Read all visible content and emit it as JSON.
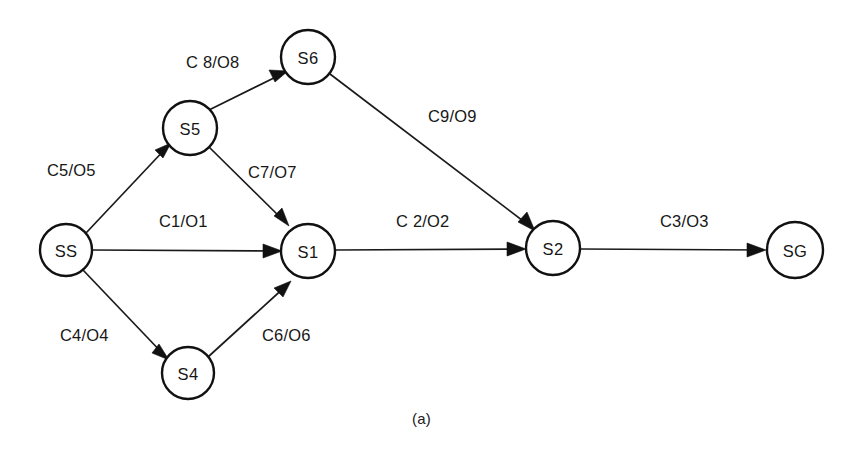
{
  "figure": {
    "caption": "(a)",
    "background_color": "#ffffff",
    "stroke_color": "#111111",
    "text_color": "#171717"
  },
  "diagram": {
    "type": "state-transition-diagram",
    "nodes": [
      {
        "id": "SS",
        "label": "SS",
        "cx": 66,
        "cy": 250,
        "r": 26
      },
      {
        "id": "S5",
        "label": "S5",
        "cx": 190,
        "cy": 128,
        "r": 27
      },
      {
        "id": "S6",
        "label": "S6",
        "cx": 308,
        "cy": 57,
        "r": 27
      },
      {
        "id": "S1",
        "label": "S1",
        "cx": 308,
        "cy": 251,
        "r": 27
      },
      {
        "id": "S4",
        "label": "S4",
        "cx": 188,
        "cy": 373,
        "r": 26
      },
      {
        "id": "S2",
        "label": "S2",
        "cx": 553,
        "cy": 248,
        "r": 27
      },
      {
        "id": "SG",
        "label": "SG",
        "cx": 795,
        "cy": 250,
        "r": 28
      }
    ],
    "edges": [
      {
        "id": "e5",
        "from": "SS",
        "to": "S5",
        "label": "C5/O5",
        "label_x": 47,
        "label_y": 162
      },
      {
        "id": "e1",
        "from": "SS",
        "to": "S1",
        "label": "C1/O1",
        "label_x": 159,
        "label_y": 213
      },
      {
        "id": "e4",
        "from": "SS",
        "to": "S4",
        "label": "C4/O4",
        "label_x": 60,
        "label_y": 327
      },
      {
        "id": "e8",
        "from": "S5",
        "to": "S6",
        "label": "C 8/O8",
        "label_x": 186,
        "label_y": 54
      },
      {
        "id": "e7",
        "from": "S5",
        "to": "S1",
        "label": "C7/O7",
        "label_x": 248,
        "label_y": 164
      },
      {
        "id": "e6",
        "from": "S4",
        "to": "S1",
        "label": "C6/O6",
        "label_x": 262,
        "label_y": 327
      },
      {
        "id": "e9",
        "from": "S6",
        "to": "S2",
        "label": "C9/O9",
        "label_x": 428,
        "label_y": 108
      },
      {
        "id": "e2",
        "from": "S1",
        "to": "S2",
        "label": "C 2/O2",
        "label_x": 396,
        "label_y": 213
      },
      {
        "id": "e3",
        "from": "S2",
        "to": "SG",
        "label": "C3/O3",
        "label_x": 660,
        "label_y": 213
      }
    ]
  }
}
